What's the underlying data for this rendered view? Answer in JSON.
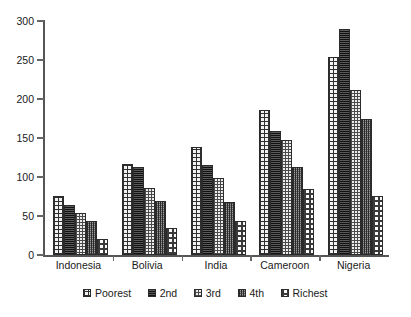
{
  "chart_data": {
    "type": "bar",
    "title": "",
    "subtitle": "",
    "xlabel": "",
    "ylabel": "",
    "categories": [
      "Indonesia",
      "Bolivia",
      "India",
      "Cameroon",
      "Nigeria"
    ],
    "series": [
      {
        "name": "Poorest",
        "values": [
          76,
          117,
          138,
          186,
          254
        ],
        "pattern": "coarse-checkerboard"
      },
      {
        "name": "2nd",
        "values": [
          64,
          113,
          116,
          159,
          290
        ],
        "pattern": "dark-dense-horizontal"
      },
      {
        "name": "3rd",
        "values": [
          54,
          86,
          99,
          147,
          211
        ],
        "pattern": "light-fine-dots"
      },
      {
        "name": "4th",
        "values": [
          44,
          69,
          68,
          113,
          175
        ],
        "pattern": "mid-grey-vertical-grid"
      },
      {
        "name": "Richest",
        "values": [
          21,
          35,
          43,
          85,
          76
        ],
        "pattern": "light-checkerboard"
      }
    ],
    "ylim": [
      0,
      300
    ],
    "ytick_values": [
      0,
      50,
      100,
      150,
      200,
      250,
      300
    ],
    "ytick_labels": [
      "0",
      "50",
      "100",
      "150",
      "200",
      "250",
      "300"
    ],
    "grid": false,
    "legend_position": "bottom",
    "legend_entries": [
      "Poorest",
      "2nd",
      "3rd",
      "4th",
      "Richest"
    ],
    "annotations": []
  },
  "axis": {
    "y_max": 300,
    "y_min": 0
  }
}
